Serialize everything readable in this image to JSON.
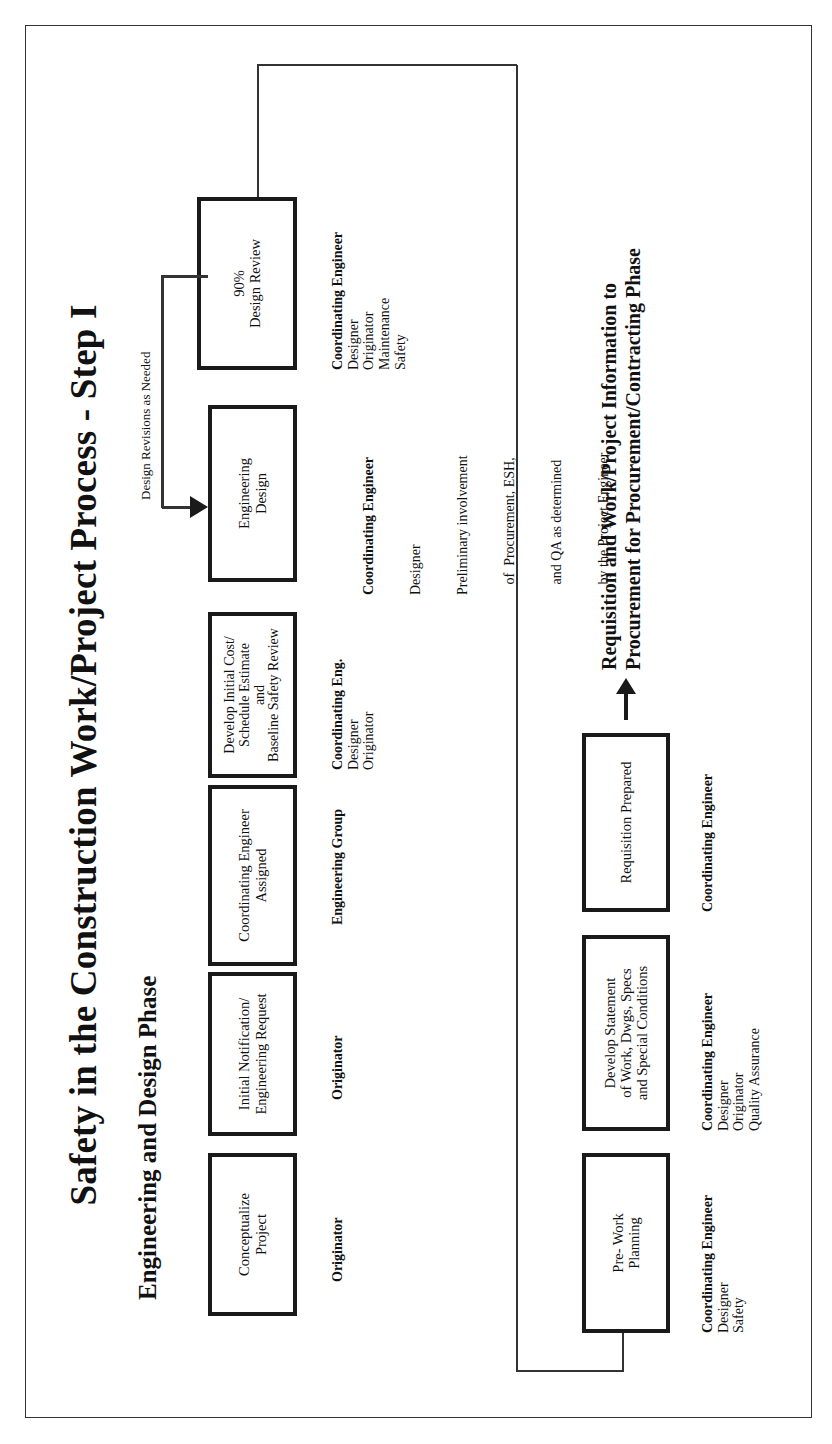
{
  "title": "Safety in the Construction Work/Project Process - Step I",
  "subtitle": "Engineering and Design Phase",
  "design_revisions_label": "Design Revisions as Needed",
  "row1": [
    {
      "id": "conceptualize",
      "lines": [
        "Conceptualize",
        "Project"
      ],
      "roles_lead": "Originator",
      "roles": []
    },
    {
      "id": "initial-notification",
      "lines": [
        "Initial Notification/",
        "Engineering Request"
      ],
      "roles_lead": "Originator",
      "roles": []
    },
    {
      "id": "coordinating-engineer-assigned",
      "lines": [
        "Coordinating Engineer",
        "Assigned"
      ],
      "roles_lead": "Engineering Group",
      "roles": []
    },
    {
      "id": "develop-initial-cost",
      "lines": [
        "Develop Initial Cost/",
        "Schedule Estimate",
        "and",
        "Baseline Safety Review"
      ],
      "roles_lead": "Coordinating Eng.",
      "roles": [
        "Designer",
        "Originator"
      ]
    },
    {
      "id": "engineering-design",
      "lines": [
        "Engineering",
        "Design"
      ],
      "roles_lead": "Coordinating Engineer",
      "roles": [
        "Designer",
        "Preliminary involvement",
        "   of  Procurement, ESH,",
        "   and QA as determined",
        "   by the Project Engineer"
      ]
    },
    {
      "id": "design-review-90",
      "lines": [
        "90%",
        "Design Review"
      ],
      "roles_lead": "Coordinating Engineer",
      "roles": [
        "Designer",
        "Originator",
        "Maintenance",
        "Safety"
      ]
    }
  ],
  "row2": [
    {
      "id": "pre-work-planning",
      "lines": [
        "Pre- Work",
        "Planning"
      ],
      "roles_lead": "Coordinating Engineer",
      "roles": [
        "Designer",
        "Safety"
      ]
    },
    {
      "id": "develop-statement",
      "lines": [
        "Develop Statement",
        "of Work, Dwgs, Specs",
        "and Special Conditions"
      ],
      "roles_lead": "Coordinating Engineer",
      "roles": [
        "Designer",
        "Originator",
        "Quality Assurance"
      ]
    },
    {
      "id": "requisition-prepared",
      "lines": [
        "Requisition  Prepared"
      ],
      "roles_lead": "Coordinating Engineer",
      "roles": []
    }
  ],
  "handoff": {
    "line1": "Requisition and Work/Project Information to",
    "line2": "Procurement for Procurement/Contracting Phase"
  },
  "colors": {
    "ink": "#1a1a1a",
    "background": "#ffffff"
  }
}
